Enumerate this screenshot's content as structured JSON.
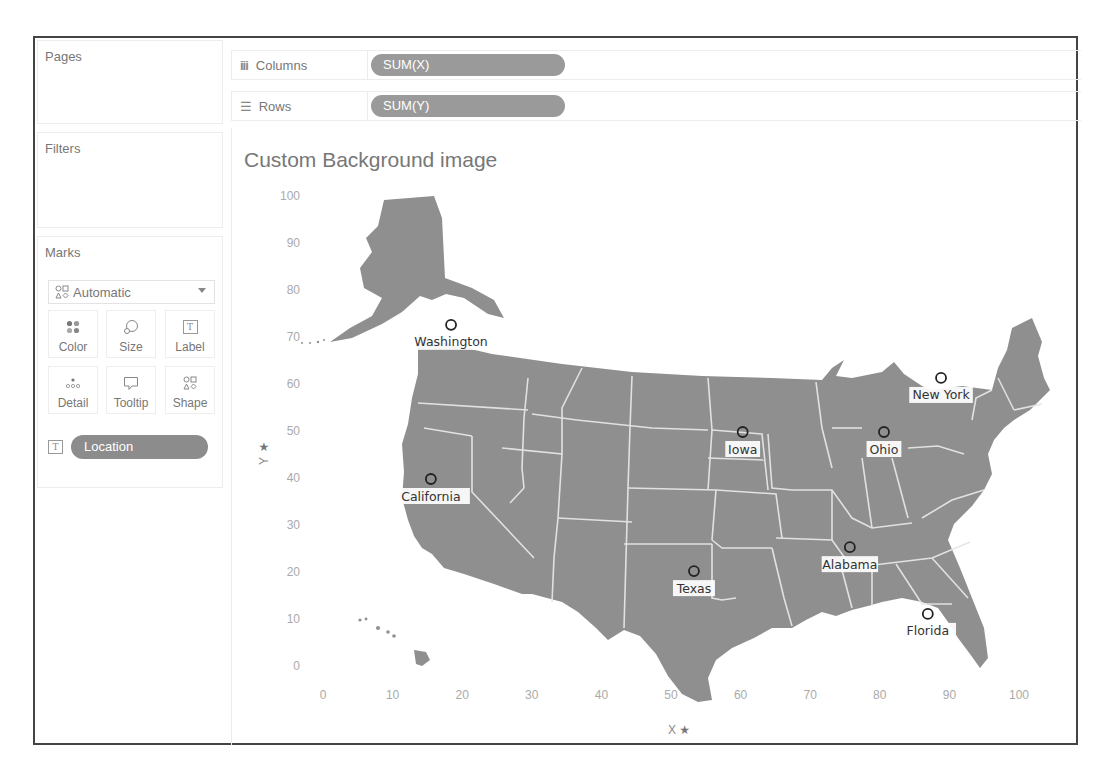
{
  "sidebar": {
    "pages_title": "Pages",
    "filters_title": "Filters",
    "marks": {
      "title": "Marks",
      "mark_type": "Automatic",
      "buttons": [
        {
          "label": "Color",
          "icon": "color-dots-icon"
        },
        {
          "label": "Size",
          "icon": "size-icon"
        },
        {
          "label": "Label",
          "icon": "label-t-icon"
        },
        {
          "label": "Detail",
          "icon": "detail-icon"
        },
        {
          "label": "Tooltip",
          "icon": "tooltip-icon"
        },
        {
          "label": "Shape",
          "icon": "shape-icon"
        }
      ],
      "field_pill": {
        "label": "Location",
        "type_icon": "T"
      }
    }
  },
  "shelves": {
    "columns": {
      "label": "Columns",
      "icon": "iii",
      "pill": "SUM(X)"
    },
    "rows": {
      "label": "Rows",
      "icon": "☰",
      "pill": "SUM(Y)"
    }
  },
  "colors": {
    "map_fill": "#8f8f8f",
    "state_border": "#e8e8e8",
    "pill_bg": "#9a9a9a",
    "frame": "#444444"
  },
  "chart_data": {
    "type": "scatter",
    "title": "Custom Background image",
    "xlabel": "X",
    "ylabel": "Y",
    "xlim": [
      0,
      100
    ],
    "ylim": [
      0,
      100
    ],
    "x_ticks": [
      "0",
      "10",
      "20",
      "30",
      "40",
      "50",
      "60",
      "70",
      "80",
      "90",
      "100"
    ],
    "y_ticks": [
      "100",
      "90",
      "80",
      "70",
      "60",
      "50",
      "40",
      "30",
      "20",
      "10",
      "0"
    ],
    "grid": false,
    "background": "US states map image",
    "points": [
      {
        "label": "Washington",
        "x": 18.4,
        "y": 72.8
      },
      {
        "label": "California",
        "x": 15.5,
        "y": 40.0
      },
      {
        "label": "Iowa",
        "x": 60.3,
        "y": 50.0
      },
      {
        "label": "Ohio",
        "x": 80.6,
        "y": 50.0
      },
      {
        "label": "New York",
        "x": 88.8,
        "y": 61.5
      },
      {
        "label": "Texas",
        "x": 53.3,
        "y": 20.4
      },
      {
        "label": "Alabama",
        "x": 75.7,
        "y": 25.5
      },
      {
        "label": "Florida",
        "x": 86.9,
        "y": 11.3
      }
    ]
  }
}
